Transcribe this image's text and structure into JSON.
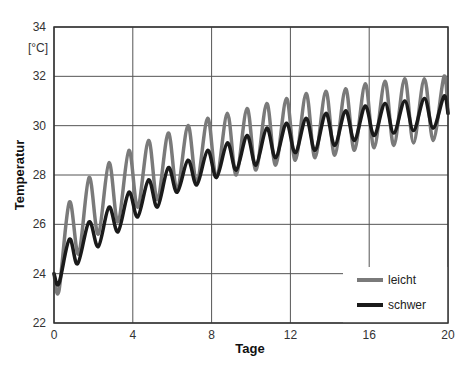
{
  "chart_data": {
    "type": "line",
    "title": "",
    "xlabel": "Tage",
    "ylabel": "Temperatur",
    "yunit": "[°C]",
    "xlim": [
      0,
      20
    ],
    "ylim": [
      22,
      34
    ],
    "xticks": [
      0,
      4,
      8,
      12,
      16,
      20
    ],
    "yticks": [
      22,
      24,
      26,
      28,
      30,
      32,
      34
    ],
    "grid": true,
    "legend_position": "lower right",
    "series": [
      {
        "name": "leicht",
        "color": "#7a7a7a",
        "x": [
          0,
          0.25,
          0.78,
          1.25,
          1.78,
          2.25,
          2.79,
          3.25,
          3.8,
          4.25,
          4.8,
          5.25,
          5.8,
          6.25,
          6.8,
          7.25,
          7.8,
          8.25,
          8.8,
          9.25,
          9.8,
          10.25,
          10.8,
          11.25,
          11.8,
          12.25,
          12.8,
          13.25,
          13.8,
          14.25,
          14.8,
          15.25,
          15.8,
          16.25,
          16.8,
          17.25,
          17.8,
          18.25,
          18.8,
          19.25,
          19.8,
          20
        ],
        "y": [
          24.0,
          23.3,
          26.9,
          24.8,
          27.9,
          25.6,
          28.5,
          26.1,
          29.0,
          26.7,
          29.4,
          27.0,
          29.7,
          27.4,
          30.0,
          27.7,
          30.3,
          27.9,
          30.5,
          28.0,
          30.7,
          28.2,
          30.9,
          28.4,
          31.1,
          28.6,
          31.3,
          28.7,
          31.4,
          28.8,
          31.5,
          29.0,
          31.7,
          29.1,
          31.8,
          29.2,
          31.9,
          29.3,
          31.9,
          29.4,
          32.0,
          30.5
        ]
      },
      {
        "name": "schwer",
        "color": "#1a1a1a",
        "x": [
          0,
          0.25,
          0.78,
          1.2,
          1.78,
          2.25,
          2.79,
          3.25,
          3.8,
          4.25,
          4.8,
          5.25,
          5.8,
          6.25,
          6.8,
          7.25,
          7.8,
          8.25,
          8.8,
          9.25,
          9.8,
          10.25,
          10.8,
          11.25,
          11.8,
          12.25,
          12.8,
          13.25,
          13.8,
          14.25,
          14.8,
          15.25,
          15.8,
          16.25,
          16.8,
          17.25,
          17.8,
          18.25,
          18.8,
          19.25,
          19.8,
          20
        ],
        "y": [
          24.0,
          23.6,
          25.4,
          24.4,
          26.1,
          25.1,
          26.7,
          25.7,
          27.3,
          26.3,
          27.8,
          26.7,
          28.3,
          27.3,
          28.6,
          27.6,
          29.0,
          27.9,
          29.3,
          28.2,
          29.6,
          28.4,
          29.9,
          28.7,
          30.1,
          28.9,
          30.3,
          29.0,
          30.5,
          29.2,
          30.6,
          29.4,
          30.8,
          29.6,
          30.9,
          29.7,
          31.0,
          29.8,
          31.1,
          29.9,
          31.2,
          30.5
        ]
      }
    ]
  },
  "labels": {
    "xlabel": "Tage",
    "ylabel": "Temperatur",
    "yunit": "[°C]",
    "legend": [
      "leicht",
      "schwer"
    ]
  }
}
